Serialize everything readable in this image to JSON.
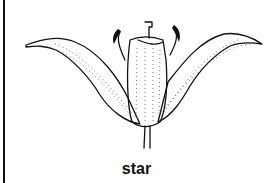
{
  "diagram": {
    "caption": "star",
    "line_color": "#111111",
    "background": "#ffffff"
  }
}
